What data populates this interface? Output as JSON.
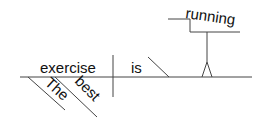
{
  "diagram": {
    "type": "reed-kellogg-sentence-diagram",
    "sentence_words": {
      "subject": "exercise",
      "verb": "is",
      "predicate_complement": "running",
      "modifiers": [
        "The",
        "best"
      ]
    },
    "colors": {
      "line": "#444444",
      "text": "#111111",
      "background": "#ffffff"
    }
  }
}
